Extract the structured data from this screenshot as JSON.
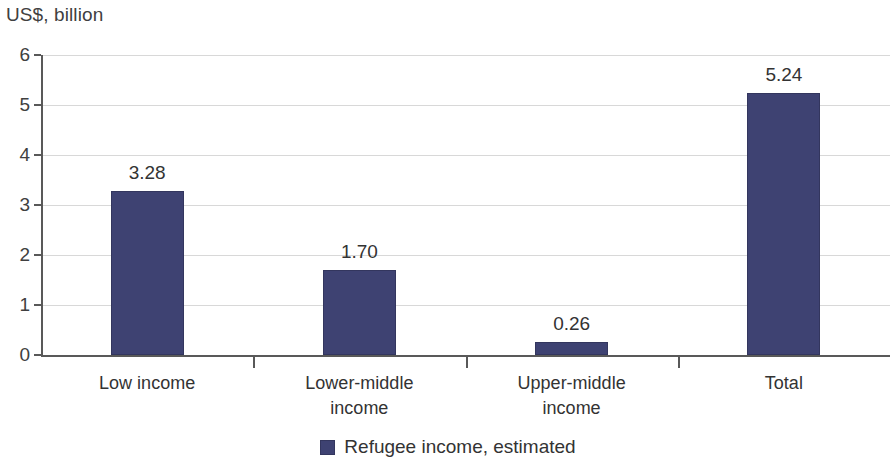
{
  "chart_data": {
    "type": "bar",
    "title": "US$, billion",
    "xlabel": "",
    "ylabel": "US$, billion",
    "categories": [
      "Low income",
      "Lower-middle income",
      "Upper-middle income",
      "Total"
    ],
    "category_lines": [
      [
        "Low income"
      ],
      [
        "Lower-middle",
        "income"
      ],
      [
        "Upper-middle",
        "income"
      ],
      [
        "Total"
      ]
    ],
    "values": [
      3.28,
      1.7,
      0.26,
      5.24
    ],
    "value_labels": [
      "3.28",
      "1.70",
      "0.26",
      "5.24"
    ],
    "series": [
      {
        "name": "Refugee income, estimated",
        "values": [
          3.28,
          1.7,
          0.26,
          5.24
        ],
        "color": "#3e4272"
      }
    ],
    "ylim": [
      0,
      6
    ],
    "y_ticks": [
      0,
      1,
      2,
      3,
      4,
      5,
      6
    ],
    "y_tick_labels": [
      "0",
      "1",
      "2",
      "3",
      "4",
      "5",
      "6"
    ],
    "grid": true,
    "grid_color": "#d8d8d8",
    "axis_color": "#595959",
    "legend": {
      "position": "bottom",
      "entries": [
        {
          "label": "Refugee income, estimated",
          "color": "#3e4272"
        }
      ]
    }
  },
  "legend": {
    "label": "Refugee income, estimated"
  }
}
